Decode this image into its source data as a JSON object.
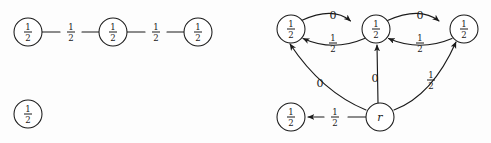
{
  "figure": {
    "background_color": "#fdfdfd",
    "stroke_color": "#1a1a1a",
    "width": 491,
    "height": 143
  },
  "left_diagram": {
    "name": "undirected-chain-graph",
    "nodes": [
      {
        "id": "L1",
        "label_numerator": "1",
        "label_denominator": "2",
        "cx": 28,
        "cy": 32,
        "r": 14
      },
      {
        "id": "L2",
        "label_numerator": "1",
        "label_denominator": "2",
        "cx": 113,
        "cy": 32,
        "r": 14
      },
      {
        "id": "L3",
        "label_numerator": "1",
        "label_denominator": "2",
        "cx": 198,
        "cy": 32,
        "r": 14
      },
      {
        "id": "L4",
        "label_numerator": "1",
        "label_denominator": "2",
        "cx": 28,
        "cy": 114,
        "r": 14
      }
    ],
    "edges": [
      {
        "from": "L1",
        "to": "L2",
        "label_numerator": "1",
        "label_denominator": "2",
        "label_x": 71,
        "label_y": 32
      },
      {
        "from": "L2",
        "to": "L3",
        "label_numerator": "1",
        "label_denominator": "2",
        "label_x": 156,
        "label_y": 32
      }
    ]
  },
  "right_diagram": {
    "name": "directed-root-graph",
    "nodes": [
      {
        "id": "R1",
        "label_numerator": "1",
        "label_denominator": "2",
        "cx": 291,
        "cy": 29,
        "r": 14
      },
      {
        "id": "R2",
        "label_numerator": "1",
        "label_denominator": "2",
        "cx": 376,
        "cy": 29,
        "r": 14
      },
      {
        "id": "R3",
        "label_numerator": "1",
        "label_denominator": "2",
        "cx": 464,
        "cy": 29,
        "r": 14
      },
      {
        "id": "R4",
        "label_numerator": "1",
        "label_denominator": "2",
        "cx": 291,
        "cy": 117,
        "r": 14
      },
      {
        "id": "R5",
        "label_text": "r",
        "cx": 380,
        "cy": 117,
        "r": 14
      }
    ],
    "edge_labels": [
      {
        "id": "e_R1_R2",
        "text": "0",
        "x": 333,
        "y": 15,
        "kind": "plain"
      },
      {
        "id": "e_R2_R1",
        "numerator": "1",
        "denominator": "2",
        "x": 333,
        "y": 43,
        "kind": "fraction"
      },
      {
        "id": "e_R2_R3",
        "text": "0",
        "x": 420,
        "y": 15,
        "kind": "plain"
      },
      {
        "id": "e_R3_R2",
        "numerator": "1",
        "denominator": "2",
        "x": 420,
        "y": 43,
        "kind": "fraction"
      },
      {
        "id": "e_r_R1",
        "text": "0",
        "x": 320,
        "y": 83,
        "kind": "plain"
      },
      {
        "id": "e_r_R2",
        "text": "0",
        "x": 375,
        "y": 78,
        "kind": "plain"
      },
      {
        "id": "e_r_R3",
        "numerator": "1",
        "denominator": "2",
        "x": 431,
        "y": 80,
        "kind": "fraction"
      },
      {
        "id": "e_r_R4",
        "numerator": "1",
        "denominator": "2",
        "x": 335,
        "y": 117,
        "kind": "fraction"
      }
    ]
  }
}
